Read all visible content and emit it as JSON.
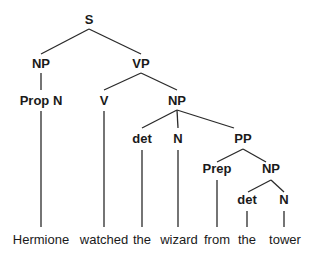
{
  "diagram": {
    "type": "syntax-tree",
    "nodes": [
      {
        "id": "S",
        "label": "S",
        "x": 89,
        "y": 24
      },
      {
        "id": "NP1",
        "label": "NP",
        "x": 41,
        "y": 68
      },
      {
        "id": "VP",
        "label": "VP",
        "x": 141,
        "y": 68
      },
      {
        "id": "PropN",
        "label": "Prop N",
        "x": 41,
        "y": 105
      },
      {
        "id": "V",
        "label": "V",
        "x": 104,
        "y": 105
      },
      {
        "id": "NP2",
        "label": "NP",
        "x": 177,
        "y": 105
      },
      {
        "id": "det1",
        "label": "det",
        "x": 142,
        "y": 143
      },
      {
        "id": "N1",
        "label": "N",
        "x": 178,
        "y": 143
      },
      {
        "id": "PP",
        "label": "PP",
        "x": 243,
        "y": 143
      },
      {
        "id": "Prep",
        "label": "Prep",
        "x": 217,
        "y": 173
      },
      {
        "id": "NP3",
        "label": "NP",
        "x": 271,
        "y": 173
      },
      {
        "id": "det2",
        "label": "det",
        "x": 247,
        "y": 204
      },
      {
        "id": "N2",
        "label": "N",
        "x": 284,
        "y": 204
      }
    ],
    "edges": [
      {
        "x1": 89,
        "y1": 29,
        "x2": 41,
        "y2": 54
      },
      {
        "x1": 89,
        "y1": 29,
        "x2": 141,
        "y2": 54
      },
      {
        "x1": 41,
        "y1": 73,
        "x2": 41,
        "y2": 90
      },
      {
        "x1": 141,
        "y1": 73,
        "x2": 104,
        "y2": 90
      },
      {
        "x1": 141,
        "y1": 73,
        "x2": 177,
        "y2": 90
      },
      {
        "x1": 41,
        "y1": 111,
        "x2": 41,
        "y2": 227
      },
      {
        "x1": 104,
        "y1": 111,
        "x2": 104,
        "y2": 227
      },
      {
        "x1": 177,
        "y1": 110,
        "x2": 142,
        "y2": 128
      },
      {
        "x1": 177,
        "y1": 110,
        "x2": 178,
        "y2": 128
      },
      {
        "x1": 177,
        "y1": 110,
        "x2": 234,
        "y2": 128
      },
      {
        "x1": 142,
        "y1": 150,
        "x2": 142,
        "y2": 227
      },
      {
        "x1": 178,
        "y1": 150,
        "x2": 178,
        "y2": 227
      },
      {
        "x1": 243,
        "y1": 149,
        "x2": 217,
        "y2": 162
      },
      {
        "x1": 243,
        "y1": 149,
        "x2": 266,
        "y2": 162
      },
      {
        "x1": 217,
        "y1": 180,
        "x2": 217,
        "y2": 227
      },
      {
        "x1": 271,
        "y1": 180,
        "x2": 248,
        "y2": 192
      },
      {
        "x1": 271,
        "y1": 180,
        "x2": 284,
        "y2": 192
      },
      {
        "x1": 247,
        "y1": 211,
        "x2": 247,
        "y2": 227
      },
      {
        "x1": 284,
        "y1": 211,
        "x2": 284,
        "y2": 227
      }
    ],
    "words": [
      {
        "text": "Hermione",
        "x": 41
      },
      {
        "text": "watched",
        "x": 104
      },
      {
        "text": "the",
        "x": 142
      },
      {
        "text": "wizard",
        "x": 179
      },
      {
        "text": "from",
        "x": 217
      },
      {
        "text": "the",
        "x": 247
      },
      {
        "text": "tower",
        "x": 285
      }
    ],
    "word_baseline": 244
  }
}
